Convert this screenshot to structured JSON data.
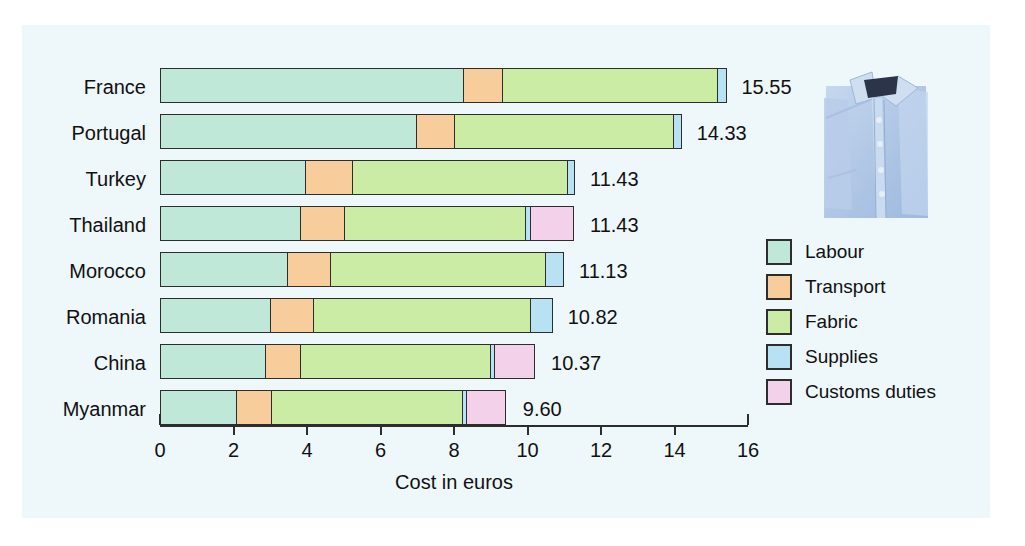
{
  "chart_data": {
    "type": "bar",
    "orientation": "horizontal",
    "stacked": true,
    "title": "",
    "xlabel": "Cost in euros",
    "ylabel": "",
    "xlim": [
      0,
      16
    ],
    "xticks": [
      0,
      2,
      4,
      6,
      8,
      10,
      12,
      14,
      16
    ],
    "xtick_labels": [
      "0",
      "2",
      "4",
      "6",
      "8",
      "10",
      "12",
      "14",
      "16"
    ],
    "grid": false,
    "legend_position": "right",
    "categories": [
      "France",
      "Portugal",
      "Turkey",
      "Thailand",
      "Morocco",
      "Romania",
      "China",
      "Myanmar"
    ],
    "series": [
      {
        "name": "Labour",
        "color": "#bfe8d9",
        "values": [
          8.3,
          7.0,
          4.0,
          3.85,
          3.5,
          3.05,
          2.9,
          2.1
        ]
      },
      {
        "name": "Transport",
        "color": "#f8cd9c",
        "values": [
          1.1,
          1.1,
          1.3,
          1.25,
          1.2,
          1.2,
          1.0,
          1.0
        ]
      },
      {
        "name": "Fabric",
        "color": "#cbeca4",
        "values": [
          5.9,
          6.0,
          5.9,
          4.95,
          5.9,
          5.95,
          5.2,
          5.25
        ]
      },
      {
        "name": "Supplies",
        "color": "#b9e1f4",
        "values": [
          0.25,
          0.23,
          0.23,
          0.2,
          0.53,
          0.62,
          0.15,
          0.15
        ]
      },
      {
        "name": "Customs duties",
        "color": "#f4d1ea",
        "values": [
          0.0,
          0.0,
          0.0,
          1.18,
          0.0,
          0.0,
          1.12,
          1.1
        ]
      }
    ],
    "totals": [
      "15.55",
      "14.33",
      "11.43",
      "11.43",
      "11.13",
      "10.82",
      "10.37",
      "9.60"
    ],
    "totals_numeric": [
      15.55,
      14.33,
      11.43,
      11.43,
      11.13,
      10.82,
      10.37,
      9.6
    ]
  },
  "legend": {
    "items": [
      {
        "label": "Labour",
        "color": "#bfe8d9"
      },
      {
        "label": "Transport",
        "color": "#f8cd9c"
      },
      {
        "label": "Fabric",
        "color": "#cbeca4"
      },
      {
        "label": "Supplies",
        "color": "#b9e1f4"
      },
      {
        "label": "Customs duties",
        "color": "#f4d1ea"
      }
    ]
  },
  "photo": {
    "name": "folded-dress-shirt",
    "color": "#aec6e8"
  },
  "colors": {
    "background": "#ffffff",
    "panel": "#eef7fa",
    "ink": "#2d2d2d",
    "text": "#111111"
  }
}
